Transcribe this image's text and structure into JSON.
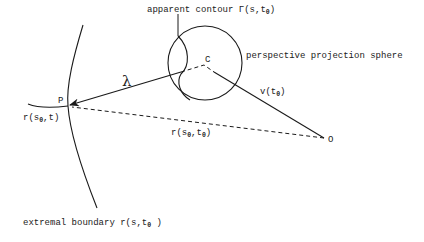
{
  "diagram": {
    "labels": {
      "apparent_contour": "apparent contour Γ(s,t",
      "apparent_contour_sub": "0",
      "apparent_contour_close": ")",
      "sphere": "perspective projection sphere",
      "center": "C",
      "point_p": "P",
      "origin": "O",
      "lambda": "λ",
      "velocity": "v(t",
      "velocity_sub": "0",
      "velocity_close": ")",
      "r_s0_t": "r(s",
      "r_s0_t_sub": "0",
      "r_s0_t_close": ",t)",
      "r_s0_t0": "r(s",
      "r_s0_t0_sub1": "0",
      "r_s0_t0_mid": ",t",
      "r_s0_t0_sub2": "0",
      "r_s0_t0_close": ")",
      "extremal": "extremal boundary r(s,t",
      "extremal_sub": "0",
      "extremal_close": " )"
    },
    "colors": {
      "stroke": "#1a1a1a",
      "background": "#ffffff"
    }
  }
}
